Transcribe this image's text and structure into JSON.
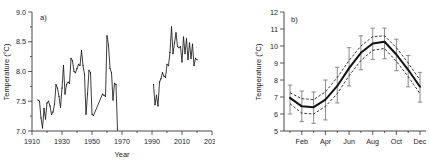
{
  "figure": {
    "panels": [
      "a",
      "b"
    ],
    "axis_color": "#333333",
    "series_color": "#1a1a1a",
    "ci_color": "#111111",
    "errorbar_color": "#6f6f6f"
  },
  "panel_a": {
    "label": "a)",
    "ylabel": "Temperature (°C)",
    "xlabel": "Year",
    "yticks": [
      "7.0",
      "7.5",
      "8.0",
      "8.5",
      "9.0"
    ],
    "xticks": [
      "1910",
      "1930",
      "1950",
      "1970",
      "1990",
      "2010",
      "2030"
    ]
  },
  "panel_b": {
    "label": "b)",
    "ylabel": "Temperature (°C)",
    "xlabel": "",
    "yticks": [
      "5",
      "6",
      "7",
      "8",
      "9",
      "10",
      "11",
      "12"
    ],
    "xticks": [
      "Feb",
      "Apr",
      "Jun",
      "Aug",
      "Oct",
      "Dec"
    ]
  },
  "chart_data": [
    {
      "type": "line",
      "panel": "a",
      "title": "",
      "xlabel": "Year",
      "ylabel": "Temperature (°C)",
      "xlim": [
        1910,
        2030
      ],
      "ylim": [
        7.0,
        9.0
      ],
      "xticks": [
        1910,
        1930,
        1950,
        1970,
        1990,
        2010,
        2030
      ],
      "yticks": [
        7.0,
        7.5,
        8.0,
        8.5,
        9.0
      ],
      "grid": false,
      "legend": "none",
      "markers": true,
      "note": "Annual mean temperature series with a data gap between 1968 and 1990",
      "segments": [
        {
          "name": "1914-1967",
          "x": [
            1914,
            1915,
            1916,
            1917,
            1918,
            1919,
            1920,
            1921,
            1922,
            1923,
            1924,
            1925,
            1926,
            1927,
            1928,
            1929,
            1930,
            1931,
            1932,
            1933,
            1934,
            1935,
            1936,
            1937,
            1938,
            1939,
            1940,
            1941,
            1942,
            1943,
            1944,
            1945,
            1946,
            1947,
            1948,
            1949,
            1950,
            1951,
            1957,
            1958,
            1959,
            1960,
            1961,
            1962,
            1963,
            1964,
            1965,
            1966,
            1967
          ],
          "y": [
            7.52,
            7.5,
            7.22,
            7.05,
            7.38,
            7.2,
            7.47,
            7.5,
            7.42,
            7.28,
            7.32,
            7.45,
            7.78,
            7.72,
            7.58,
            7.4,
            7.72,
            8.1,
            7.62,
            7.78,
            7.82,
            7.8,
            8.22,
            8.18,
            8.0,
            7.98,
            8.05,
            8.12,
            8.1,
            8.35,
            8.1,
            7.95,
            7.28,
            7.62,
            8.02,
            7.98,
            7.28,
            7.26,
            7.62,
            7.6,
            7.58,
            8.6,
            8.44,
            8.05,
            7.98,
            7.52,
            7.8,
            7.78,
            7.02
          ]
        },
        {
          "name": "1991-2020",
          "x": [
            1991,
            1992,
            1993,
            1994,
            1995,
            1996,
            1997,
            1998,
            1999,
            2000,
            2001,
            2002,
            2003,
            2004,
            2005,
            2006,
            2007,
            2008,
            2009,
            2010,
            2011,
            2012,
            2013,
            2014,
            2015,
            2016,
            2017,
            2018,
            2019,
            2020
          ],
          "y": [
            7.78,
            7.44,
            7.6,
            7.42,
            7.82,
            7.88,
            7.98,
            7.92,
            7.9,
            8.12,
            8.1,
            8.32,
            8.75,
            8.3,
            8.48,
            8.65,
            8.42,
            8.4,
            8.42,
            8.16,
            8.58,
            8.3,
            8.55,
            8.2,
            8.48,
            8.22,
            8.46,
            8.1,
            8.22,
            8.2
          ]
        }
      ]
    },
    {
      "type": "line",
      "panel": "b",
      "title": "",
      "xlabel": "",
      "ylabel": "Temperature (°C)",
      "xlim": [
        0.5,
        12.5
      ],
      "ylim": [
        5,
        12
      ],
      "xticks": [
        2,
        4,
        6,
        8,
        10,
        12
      ],
      "xticklabels": [
        "Feb",
        "Apr",
        "Jun",
        "Aug",
        "Oct",
        "Dec"
      ],
      "yticks": [
        5,
        6,
        7,
        8,
        9,
        10,
        11,
        12
      ],
      "grid": false,
      "legend": "none",
      "months": [
        "Jan",
        "Feb",
        "Mar",
        "Apr",
        "May",
        "Jun",
        "Jul",
        "Aug",
        "Sep",
        "Oct",
        "Nov",
        "Dec"
      ],
      "series": [
        {
          "name": "mean",
          "style": "solid",
          "values": [
            6.95,
            6.45,
            6.4,
            6.85,
            7.65,
            8.7,
            9.6,
            10.15,
            10.25,
            9.5,
            8.6,
            7.6
          ]
        },
        {
          "name": "upper confidence limit",
          "style": "dashed",
          "values": [
            7.25,
            6.9,
            6.85,
            7.3,
            8.15,
            9.15,
            10.0,
            10.55,
            10.6,
            9.9,
            9.0,
            8.0
          ]
        },
        {
          "name": "lower confidence limit",
          "style": "dashed",
          "values": [
            6.6,
            6.05,
            6.0,
            6.45,
            7.2,
            8.25,
            9.15,
            9.75,
            9.85,
            9.1,
            8.2,
            7.2
          ]
        }
      ],
      "errorbars": {
        "name": "observed range per month",
        "low": [
          6.0,
          5.55,
          5.45,
          5.65,
          6.65,
          7.65,
          8.6,
          9.2,
          9.25,
          8.55,
          7.6,
          6.7
        ],
        "high": [
          7.7,
          7.35,
          7.3,
          8.0,
          8.75,
          9.9,
          10.6,
          11.05,
          11.05,
          10.4,
          9.45,
          8.45
        ]
      }
    }
  ]
}
